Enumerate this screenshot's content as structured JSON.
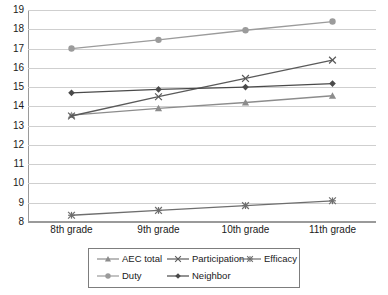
{
  "chart_data": {
    "type": "line",
    "title": "",
    "xlabel": "",
    "ylabel": "",
    "categories": [
      "8th grade",
      "9th grade",
      "10th grade",
      "11th grade"
    ],
    "ylim": [
      8,
      19
    ],
    "ytick_labels": [
      "19",
      "18",
      "17",
      "16",
      "15",
      "14",
      "13",
      "12",
      "11",
      "10",
      "9",
      "8"
    ],
    "ytick_values": [
      19,
      18,
      17,
      16,
      15,
      14,
      13,
      12,
      11,
      10,
      9,
      8
    ],
    "grid": true,
    "legend_position": "bottom",
    "series": [
      {
        "name": "AEC total",
        "marker": "triangle",
        "color": "#8c8c8c",
        "values": [
          13.55,
          13.9,
          14.2,
          14.55
        ]
      },
      {
        "name": "Participation",
        "marker": "cross",
        "color": "#5a5a5a",
        "values": [
          13.5,
          14.5,
          15.45,
          16.4
        ]
      },
      {
        "name": "Efficacy",
        "marker": "star",
        "color": "#6e6e6e",
        "values": [
          8.35,
          8.6,
          8.85,
          9.1
        ]
      },
      {
        "name": "Duty",
        "marker": "circle",
        "color": "#9b9b9b",
        "values": [
          17.0,
          17.45,
          17.95,
          18.4
        ]
      },
      {
        "name": "Neighbor",
        "marker": "diamond",
        "color": "#4a4a4a",
        "values": [
          14.7,
          14.88,
          15.0,
          15.18
        ]
      }
    ]
  },
  "legend": {
    "rows": [
      [
        "AEC total",
        "Participation",
        "Efficacy"
      ],
      [
        "Duty",
        "Neighbor"
      ]
    ]
  }
}
